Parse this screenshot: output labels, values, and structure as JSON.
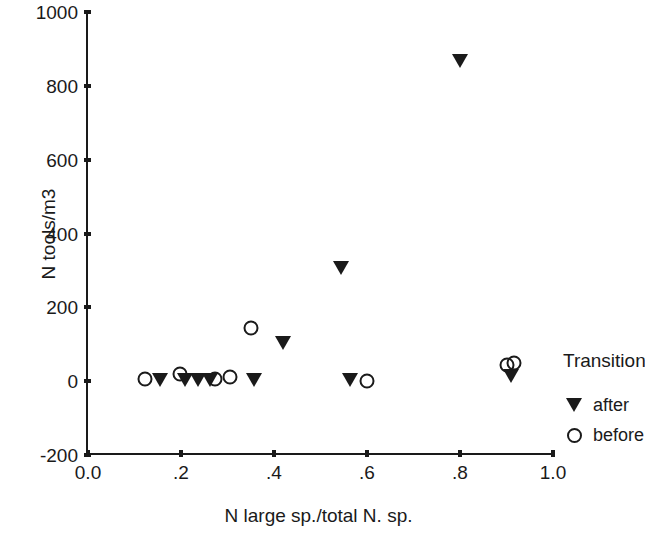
{
  "chart_data": {
    "type": "scatter",
    "title": "",
    "xlabel": "N large sp./total N. sp.",
    "ylabel": "N tools/m3",
    "xlim": [
      0.0,
      1.0
    ],
    "ylim": [
      -200,
      1000
    ],
    "xticks": [
      0.0,
      0.2,
      0.4,
      0.6,
      0.8,
      1.0
    ],
    "xtick_labels": [
      "0.0",
      ".2",
      ".4",
      ".6",
      ".8",
      "1.0"
    ],
    "yticks": [
      -200,
      0,
      200,
      400,
      600,
      800,
      1000
    ],
    "ytick_labels": [
      "-200",
      "0",
      "200",
      "400",
      "600",
      "800",
      "1000"
    ],
    "grid": false,
    "legend_position": "right",
    "legend_title": "Transition",
    "marker_color": "#1a1a1a",
    "series": [
      {
        "name": "after",
        "marker": "filled-down-triangle",
        "points": [
          {
            "x": 0.155,
            "y": 0
          },
          {
            "x": 0.208,
            "y": 0
          },
          {
            "x": 0.236,
            "y": 0
          },
          {
            "x": 0.262,
            "y": 0
          },
          {
            "x": 0.356,
            "y": 0
          },
          {
            "x": 0.42,
            "y": 100
          },
          {
            "x": 0.545,
            "y": 305
          },
          {
            "x": 0.563,
            "y": 0
          },
          {
            "x": 0.8,
            "y": 865
          },
          {
            "x": 0.91,
            "y": 10
          }
        ]
      },
      {
        "name": "before",
        "marker": "open-circle",
        "points": [
          {
            "x": 0.123,
            "y": 5
          },
          {
            "x": 0.198,
            "y": 20
          },
          {
            "x": 0.273,
            "y": 5
          },
          {
            "x": 0.305,
            "y": 10
          },
          {
            "x": 0.35,
            "y": 145
          },
          {
            "x": 0.6,
            "y": 0
          },
          {
            "x": 0.901,
            "y": 45
          },
          {
            "x": 0.916,
            "y": 50
          }
        ]
      }
    ]
  },
  "axes": {
    "x_title": "N large sp./total N. sp.",
    "y_title": "N tools/m3"
  },
  "legend": {
    "title": "Transition",
    "entries": [
      {
        "label": "after",
        "symbol": "filled-down-triangle"
      },
      {
        "label": "before",
        "symbol": "open-circle"
      }
    ]
  }
}
